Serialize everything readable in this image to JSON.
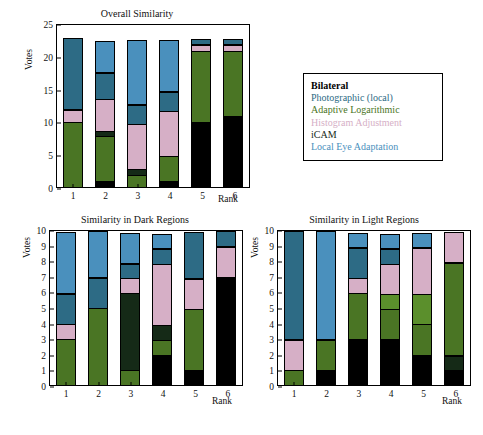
{
  "figure": {
    "caption": "",
    "series_colors": {
      "bilateral": "#000000",
      "photographic_local": "#2d6b85",
      "adaptive_logarithmic": "#4a7524",
      "histogram_adjustment": "#d6afc6",
      "icam": "#152a17",
      "local_eye_adaptation": "#4a90bd"
    }
  },
  "legend": {
    "position": "center-right",
    "items": [
      {
        "label": "Bilateral",
        "color": "#000000"
      },
      {
        "label": "Photographic (local)",
        "color": "#2d6b85"
      },
      {
        "label": "Adaptive Logarithmic",
        "color": "#4a7524"
      },
      {
        "label": "Histogram Adjustment",
        "color": "#d6afc6"
      },
      {
        "label": "iCAM",
        "color": "#152a17"
      },
      {
        "label": "Local Eye Adaptation",
        "color": "#4a90bd"
      }
    ]
  },
  "chart_data": [
    {
      "id": "overall",
      "type": "bar",
      "stacked": true,
      "title": "Overall Similarity",
      "xlabel": "Rank",
      "ylabel": "Votes",
      "categories": [
        "1",
        "2",
        "3",
        "4",
        "5",
        "6"
      ],
      "ylim": [
        0,
        25
      ],
      "yticks": [
        0,
        5,
        10,
        15,
        20,
        25
      ],
      "grid": false,
      "total_per_bar": 23,
      "series": [
        {
          "name": "Bilateral",
          "color": "#000000",
          "values": [
            0,
            1,
            0,
            1,
            10,
            11
          ]
        },
        {
          "name": "Adaptive Logarithmic",
          "color": "#4a7524",
          "values": [
            10,
            7,
            2,
            4,
            11,
            10
          ]
        },
        {
          "name": "iCAM",
          "color": "#152a17",
          "values": [
            0,
            1,
            1,
            0,
            0,
            0
          ]
        },
        {
          "name": "Histogram Adjustment",
          "color": "#d6afc6",
          "values": [
            2,
            5,
            7,
            7,
            1,
            1
          ]
        },
        {
          "name": "Photographic (local)",
          "color": "#2d6b85",
          "values": [
            11,
            4,
            3,
            3,
            1,
            1
          ]
        },
        {
          "name": "Local Eye Adaptation",
          "color": "#4a90bd",
          "values": [
            0,
            5,
            10,
            8,
            0,
            0
          ]
        }
      ]
    },
    {
      "id": "dark",
      "type": "bar",
      "stacked": true,
      "title": "Similarity in Dark Regions",
      "xlabel": "Rank",
      "ylabel": "Votes",
      "categories": [
        "1",
        "2",
        "3",
        "4",
        "5",
        "6"
      ],
      "ylim": [
        0,
        10
      ],
      "yticks": [
        0,
        1,
        2,
        3,
        4,
        5,
        6,
        7,
        8,
        9,
        10
      ],
      "grid": false,
      "total_per_bar": 10,
      "series": [
        {
          "name": "Bilateral",
          "color": "#000000",
          "values": [
            0,
            0,
            0,
            2,
            1,
            7
          ]
        },
        {
          "name": "Adaptive Logarithmic",
          "color": "#4a7524",
          "values": [
            3,
            5,
            1,
            1,
            4,
            0
          ]
        },
        {
          "name": "iCAM",
          "color": "#152a17",
          "values": [
            0,
            0,
            5,
            1,
            0,
            0
          ]
        },
        {
          "name": "Histogram Adjustment",
          "color": "#d6afc6",
          "values": [
            1,
            0,
            1,
            4,
            2,
            2
          ]
        },
        {
          "name": "Photographic (local)",
          "color": "#2d6b85",
          "values": [
            2,
            2,
            1,
            1,
            3,
            1
          ]
        },
        {
          "name": "Local Eye Adaptation",
          "color": "#4a90bd",
          "values": [
            4,
            3,
            2,
            1,
            0,
            0
          ]
        }
      ]
    },
    {
      "id": "light",
      "type": "bar",
      "stacked": true,
      "title": "Similarity in Light Regions",
      "xlabel": "Rank",
      "ylabel": "Votes",
      "categories": [
        "1",
        "2",
        "3",
        "4",
        "5",
        "6"
      ],
      "ylim": [
        0,
        10
      ],
      "yticks": [
        0,
        1,
        2,
        3,
        4,
        5,
        6,
        7,
        8,
        9,
        10
      ],
      "grid": false,
      "total_per_bar": 10,
      "series": [
        {
          "name": "Bilateral",
          "color": "#000000",
          "values": [
            0,
            1,
            3,
            3,
            2,
            1
          ]
        },
        {
          "name": "iCAM",
          "color": "#152a17",
          "values": [
            0,
            0,
            0,
            0,
            0,
            1
          ]
        },
        {
          "name": "Adaptive Logarithmic",
          "color": "#4a7524",
          "values": [
            1,
            2,
            3,
            2,
            2,
            6
          ]
        },
        {
          "name": "Adaptive Logarithmic2",
          "color": "#5b8f2c",
          "values": [
            0,
            0,
            0,
            1,
            2,
            0
          ]
        },
        {
          "name": "Histogram Adjustment",
          "color": "#d6afc6",
          "values": [
            2,
            0,
            1,
            2,
            3,
            2
          ]
        },
        {
          "name": "Photographic (local)",
          "color": "#2d6b85",
          "values": [
            7,
            0,
            2,
            1,
            0,
            0
          ]
        },
        {
          "name": "Local Eye Adaptation",
          "color": "#4a90bd",
          "values": [
            0,
            7,
            1,
            1,
            1,
            0
          ]
        }
      ]
    }
  ]
}
